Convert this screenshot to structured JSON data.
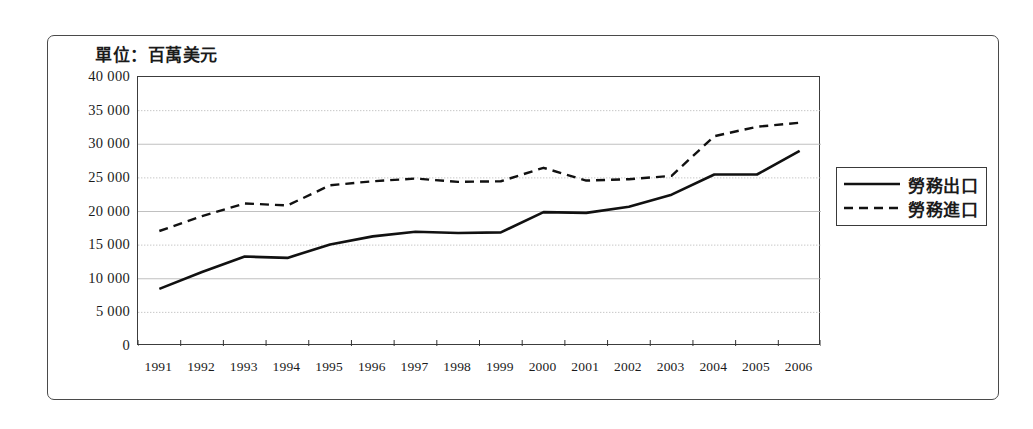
{
  "figure": {
    "unit_caption": "單位：百萬美元"
  },
  "legend": {
    "items": [
      {
        "label": "勞務出口",
        "style": "solid"
      },
      {
        "label": "勞務進口",
        "style": "dashed"
      }
    ]
  },
  "axes": {
    "y_tick_labels": [
      "40 000",
      "35 000",
      "30 000",
      "25 000",
      "20 000",
      "15 000",
      "10 000",
      "5 000",
      "0"
    ],
    "x_tick_labels": [
      "1991",
      "1992",
      "1993",
      "1994",
      "1995",
      "1996",
      "1997",
      "1998",
      "1999",
      "2000",
      "2001",
      "2002",
      "2003",
      "2004",
      "2005",
      "2006"
    ]
  },
  "colors": {
    "line": "#111111",
    "frame": "#4a4a4a",
    "grid": "#b9b9b9",
    "background": "#ffffff"
  },
  "chart_data": {
    "type": "line",
    "title": "單位：百萬美元",
    "xlabel": "",
    "ylabel": "",
    "ylim": [
      0,
      40000
    ],
    "ytick_step": 5000,
    "grid": true,
    "legend_position": "right",
    "x": [
      "1991",
      "1992",
      "1993",
      "1994",
      "1995",
      "1996",
      "1997",
      "1998",
      "1999",
      "2000",
      "2001",
      "2002",
      "2003",
      "2004",
      "2005",
      "2006"
    ],
    "categories": [
      "1991",
      "1992",
      "1993",
      "1994",
      "1995",
      "1996",
      "1997",
      "1998",
      "1999",
      "2000",
      "2001",
      "2002",
      "2003",
      "2004",
      "2005",
      "2006"
    ],
    "series": [
      {
        "name": "勞務出口",
        "style": "solid",
        "values": [
          8500,
          11000,
          13300,
          13100,
          15100,
          16300,
          17000,
          16800,
          16900,
          19900,
          19800,
          20700,
          22500,
          25500,
          25500,
          29000
        ]
      },
      {
        "name": "勞務進口",
        "style": "dashed",
        "values": [
          17100,
          19300,
          21200,
          20900,
          23900,
          24500,
          24900,
          24400,
          24500,
          26500,
          24600,
          24800,
          25300,
          31200,
          32600,
          33200
        ]
      }
    ]
  }
}
